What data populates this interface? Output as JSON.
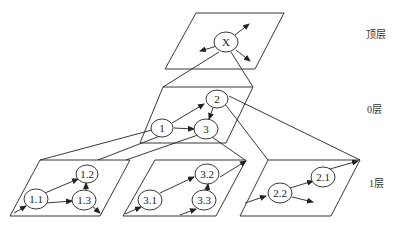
{
  "diagram": {
    "layers": {
      "top": {
        "label": "顶层"
      },
      "zero": {
        "label": "0层"
      },
      "one": {
        "label": "1层"
      }
    },
    "nodes": {
      "x": "X",
      "n1": "1",
      "n2": "2",
      "n3": "3",
      "n11": "1.1",
      "n12": "1.2",
      "n13": "1.3",
      "n31": "3.1",
      "n32": "3.2",
      "n33": "3.3",
      "n21": "2.1",
      "n22": "2.2"
    },
    "edges": [
      [
        "1",
        "2"
      ],
      [
        "1",
        "3"
      ],
      [
        "2",
        "3"
      ],
      [
        "1.1",
        "1.2"
      ],
      [
        "1.1",
        "1.3"
      ],
      [
        "1.3",
        "1.2"
      ],
      [
        "3.1",
        "3.2"
      ],
      [
        "3.3",
        "3.2"
      ],
      [
        "2.2",
        "2.1"
      ]
    ],
    "stroke_color": "#222222",
    "background": "#ffffff"
  }
}
